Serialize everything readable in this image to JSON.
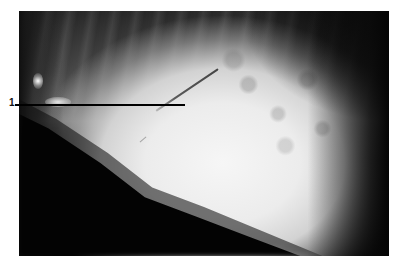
{
  "figure": {
    "type": "endoscopic-photograph",
    "annotations": [
      {
        "label": "1",
        "target": "needle-instrument"
      }
    ]
  }
}
